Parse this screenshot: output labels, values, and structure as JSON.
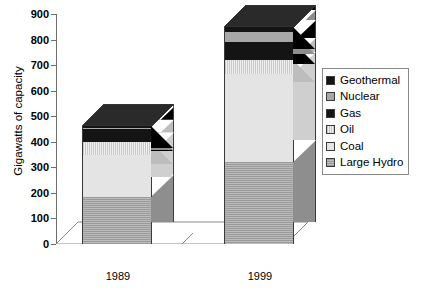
{
  "chart_data": {
    "type": "bar",
    "subtype": "stacked-column-3d",
    "title": "",
    "xlabel": "",
    "ylabel": "Gigawatts of capacity",
    "categories": [
      "1989",
      "1999"
    ],
    "ylim": [
      0,
      900
    ],
    "yticks": [
      0,
      100,
      200,
      300,
      400,
      500,
      600,
      700,
      800,
      900
    ],
    "ytick_labels": [
      "0",
      "100",
      "200",
      "300",
      "400",
      "500",
      "600",
      "700",
      "800",
      "900"
    ],
    "grid": false,
    "legend_position": "right",
    "stack_order_bottom_to_top": [
      "Large Hydro",
      "Coal",
      "Oil",
      "Gas",
      "Nuclear",
      "Geothermal"
    ],
    "series": [
      {
        "name": "Large Hydro",
        "color": "#a8a8a8",
        "pattern": "horizontal-stripe",
        "values": [
          185,
          320
        ]
      },
      {
        "name": "Coal",
        "color": "#e4e4e4",
        "pattern": "solid-very-light",
        "values": [
          165,
          345
        ]
      },
      {
        "name": "Oil",
        "color": "#d8d8d8",
        "pattern": "vertical-stripe",
        "values": [
          50,
          55
        ]
      },
      {
        "name": "Gas",
        "color": "#141414",
        "pattern": "solid-black",
        "values": [
          50,
          70
        ]
      },
      {
        "name": "Nuclear",
        "color": "#a8a8a8",
        "pattern": "solid-gray",
        "values": [
          5,
          40
        ]
      },
      {
        "name": "Geothermal",
        "color": "#141414",
        "pattern": "solid-black",
        "values": [
          5,
          20
        ]
      }
    ],
    "totals": [
      460,
      850
    ]
  },
  "legend": {
    "items": [
      {
        "label": "Geothermal",
        "swatch": "solid-black"
      },
      {
        "label": "Nuclear",
        "swatch": "solid-gray"
      },
      {
        "label": "Gas",
        "swatch": "solid-black"
      },
      {
        "label": "Oil",
        "swatch": "vertical-stripe"
      },
      {
        "label": "Coal",
        "swatch": "solid-very-light"
      },
      {
        "label": "Large Hydro",
        "swatch": "horizontal-stripe"
      }
    ]
  }
}
